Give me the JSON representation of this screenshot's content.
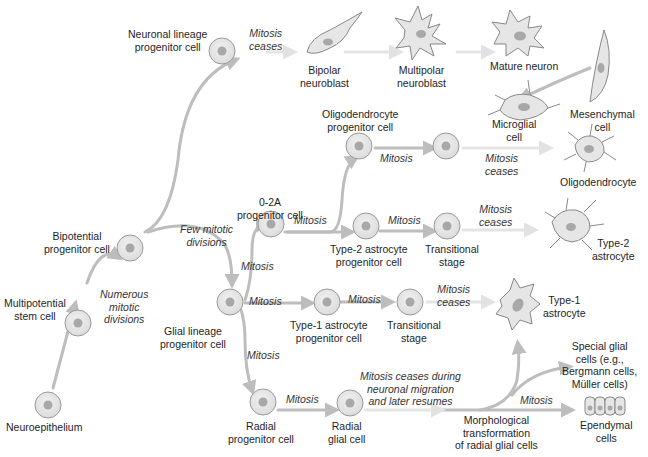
{
  "diagram": {
    "type": "cell lineage flowchart",
    "colors": {
      "arrow": "#bdbdbd",
      "arrow_faint": "#e4e4e4",
      "cell_fill": "#e6e6e6",
      "cell_stroke": "#9a9a9a",
      "nucleus": "#a8a8a8",
      "text": "#1e1e1e"
    },
    "nodes": {
      "neuroepithelium": "Neuroepithelium",
      "multipotential": "Multipotential\nstem cell",
      "bipotential": "Bipotential\nprogenitor cell",
      "neuronal_progenitor": "Neuronal lineage\nprogenitor cell",
      "bipolar": "Bipolar\nneuroblast",
      "multipolar": "Multipolar\nneuroblast",
      "mature_neuron": "Mature neuron",
      "mesenchymal": "Mesenchymal\ncell",
      "microglial": "Microglial\ncell",
      "glial_progenitor": "Glial lineage\nprogenitor cell",
      "o2a": "0-2A\nprogenitor cell",
      "oligo_progenitor": "Oligodendrocyte\nprogenitor cell",
      "oligodendrocyte": "Oligodendrocyte",
      "type2_progenitor": "Type-2 astrocyte\nprogenitor cell",
      "transitional_1": "Transitional\nstage",
      "type2_astrocyte": "Type-2\nastrocyte",
      "type1_progenitor": "Type-1 astrocyte\nprogenitor cell",
      "transitional_2": "Transitional\nstage",
      "type1_astrocyte": "Type-1\nastrocyte",
      "radial_progenitor": "Radial\nprogenitor cell",
      "radial_glial": "Radial\nglial cell",
      "morphological": "Morphological\ntransformation\nof radial glial cells",
      "special_glial": "Special glial\ncells (e.g.,\nBergmann cells,\nMüller cells)",
      "ependymal": "Ependymal\ncells"
    },
    "edge_labels": {
      "numerous": "Numerous\nmitotic\ndivisions",
      "few": "Few mitotic\ndivisions",
      "neuronal_ceases": "Mitosis\nceases",
      "o2a_to_oligo": "Mitosis",
      "oligo_ceases": "Mitosis\nceases",
      "o2a_mitosis": "Mitosis",
      "type2_mitosis": "Mitosis",
      "type2_ceases": "Mitosis\nceases",
      "glial_to_o2a": "Mitosis",
      "glial_to_type1": "Mitosis",
      "type1_mitosis": "Mitosis",
      "type1_ceases": "Mitosis\nceases",
      "glial_to_radial": "Mitosis",
      "radial_mitosis": "Mitosis",
      "radial_ceases": "Mitosis ceases during\nneuronal migration\nand later resumes",
      "ependymal_mitosis": "Mitosis"
    }
  }
}
